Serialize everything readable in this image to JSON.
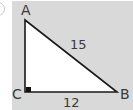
{
  "figure": {
    "type": "right-triangle",
    "vertices": [
      {
        "id": "A",
        "label": "A"
      },
      {
        "id": "B",
        "label": "B"
      },
      {
        "id": "C",
        "label": "C"
      }
    ],
    "right_angle_at": "C",
    "sides": {
      "hypotenuse_AB": {
        "label": "15"
      },
      "base_CB": {
        "label": "12"
      },
      "side_AC": {
        "label": ""
      }
    }
  },
  "colors": {
    "panel": "#d9d9d9",
    "triangle_fill": "#ffffff",
    "stroke": "#1a1a1a",
    "text": "#3a3a3a"
  }
}
